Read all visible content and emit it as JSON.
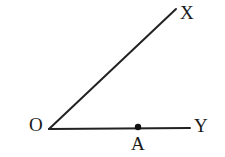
{
  "figure": {
    "kind": "geometry-diagram",
    "background_color": "#ffffff",
    "stroke_color": "#222222",
    "label_color": "#1a1a1a",
    "stroke_width": 2,
    "width": 225,
    "height": 157
  },
  "labels": {
    "vertex": "O",
    "ray_x_end": "X",
    "ray_y_end": "Y",
    "point_on_ray_y": "A"
  },
  "points": {
    "O": {
      "x": 49,
      "y": 129
    },
    "X": {
      "x": 176,
      "y": 9
    },
    "Y": {
      "x": 190,
      "y": 128
    },
    "A": {
      "x": 138,
      "y": 127,
      "marker": "filled-dot",
      "radius": 3.2
    }
  },
  "segments": [
    {
      "name": "ray-OX",
      "from": "O",
      "to": "X"
    },
    {
      "name": "ray-OY",
      "from": "O",
      "to": "Y"
    }
  ]
}
